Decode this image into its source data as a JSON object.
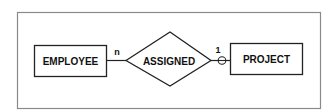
{
  "diagram": {
    "type": "entity-relationship",
    "entities": [
      {
        "id": "employee",
        "label": "EMPLOYEE"
      },
      {
        "id": "project",
        "label": "PROJECT"
      }
    ],
    "relationship": {
      "label": "ASSIGNED"
    },
    "cardinality": {
      "employee_side": "n",
      "project_side": "1"
    },
    "optionality": {
      "project_side": "optional-circle"
    },
    "colors": {
      "line": "#222222",
      "frame": "#8a8a8a",
      "background": "#ffffff"
    }
  }
}
